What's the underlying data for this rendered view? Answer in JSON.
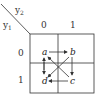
{
  "diagram": {
    "type": "karnaugh-map-state-transitions",
    "row_variable": "y1",
    "column_variable": "y2",
    "column_headers": [
      "0",
      "1"
    ],
    "row_headers": [
      "0",
      "1"
    ],
    "cells": [
      {
        "row": "0",
        "col": "0",
        "state": "a"
      },
      {
        "row": "0",
        "col": "1",
        "state": "b"
      },
      {
        "row": "1",
        "col": "1",
        "state": "c"
      },
      {
        "row": "1",
        "col": "0",
        "state": "d"
      }
    ],
    "transitions": [
      {
        "from": "a",
        "to": "b"
      },
      {
        "from": "b",
        "to": "c"
      },
      {
        "from": "c",
        "to": "d"
      },
      {
        "from": "a",
        "to": "d"
      },
      {
        "from": "d",
        "to": "a"
      },
      {
        "from": "c",
        "to": "a"
      },
      {
        "from": "b",
        "to": "d"
      }
    ],
    "colors": {
      "line": "#333333",
      "background": "#ffffff"
    }
  },
  "labels": {
    "y1_main": "y",
    "y1_sub": "1",
    "y2_main": "y",
    "y2_sub": "2",
    "col0": "0",
    "col1": "1",
    "row0": "0",
    "row1": "1",
    "a": "a",
    "b": "b",
    "c": "c",
    "d": "d"
  }
}
